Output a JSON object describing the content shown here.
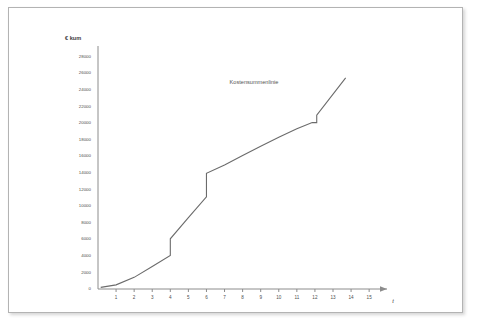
{
  "chart_data": {
    "type": "line",
    "title": "",
    "annotation": "Kostensummenlinie",
    "ylabel": "€ kum",
    "xlabel": "t",
    "xlim": [
      0,
      15.6
    ],
    "ylim": [
      0,
      28800
    ],
    "grid": false,
    "legend_position": "none",
    "x_ticks": [
      1,
      2,
      3,
      4,
      5,
      6,
      7,
      8,
      9,
      10,
      11,
      12,
      13,
      14,
      15
    ],
    "x_tick_labels": [
      "1",
      "2",
      "3",
      "4",
      "5",
      "6",
      "7",
      "8",
      "9",
      "10",
      "11",
      "12",
      "13",
      "14",
      "15"
    ],
    "y_ticks": [
      0,
      2000,
      4000,
      6000,
      8000,
      10000,
      12000,
      14000,
      16000,
      18000,
      20000,
      22000,
      24000,
      26000,
      28000
    ],
    "y_tick_labels": [
      "0",
      "2000",
      "4000",
      "6000",
      "8000",
      "10000",
      "12000",
      "14000",
      "16000",
      "18000",
      "20000",
      "22000",
      "24000",
      "26000",
      "28000"
    ],
    "series": [
      {
        "name": "Kostensummenlinie",
        "color": "#6b6b6b",
        "points": [
          [
            0.15,
            200
          ],
          [
            1.0,
            500
          ],
          [
            2.0,
            1400
          ],
          [
            3.0,
            2700
          ],
          [
            4.0,
            4050
          ],
          [
            4.0,
            6050
          ],
          [
            5.0,
            8600
          ],
          [
            6.0,
            11100
          ],
          [
            6.0,
            13950
          ],
          [
            7.0,
            14950
          ],
          [
            8.0,
            16100
          ],
          [
            9.0,
            17200
          ],
          [
            10.0,
            18300
          ],
          [
            11.0,
            19300
          ],
          [
            11.85,
            20050
          ],
          [
            12.1,
            20050
          ],
          [
            12.1,
            20950
          ],
          [
            13.7,
            25450
          ]
        ]
      }
    ]
  },
  "axis": {
    "arrow_x_label": "t",
    "y_title": "€ kum"
  }
}
